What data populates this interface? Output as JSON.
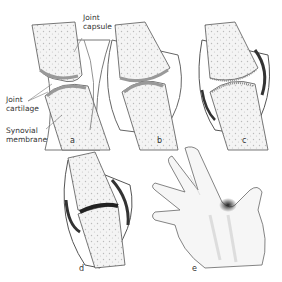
{
  "diagram": {
    "labels": {
      "joint_capsule": "Joint\ncapsule",
      "joint_cartilage": "Joint\ncartilage",
      "synovial_membrane": "Synovial\nmembrane"
    },
    "panels": [
      {
        "id": "a",
        "letter": "a",
        "description": "Normal joint"
      },
      {
        "id": "b",
        "letter": "b",
        "description": "Synovial inflammation"
      },
      {
        "id": "c",
        "letter": "c",
        "description": "Cartilage erosion"
      },
      {
        "id": "d",
        "letter": "d",
        "description": "Joint destruction"
      },
      {
        "id": "e",
        "letter": "e",
        "description": "Swollen finger joint on hand"
      }
    ],
    "colors": {
      "bone_fill": "#f2f2f2",
      "outline": "#555555",
      "cartilage": "#9a9a9a",
      "inflammation": "#2a2a2a"
    }
  }
}
